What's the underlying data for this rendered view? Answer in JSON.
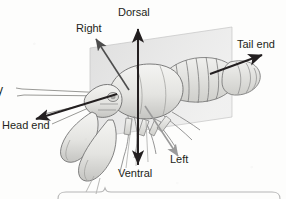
{
  "figure": {
    "organism_label": "crayfish",
    "plane_label": "sagittal plane",
    "partial_left_text": "y"
  },
  "labels": {
    "dorsal": "Dorsal",
    "ventral": "Ventral",
    "right": "Right",
    "left": "Left",
    "head_end": "Head end",
    "tail_end": "Tail end"
  },
  "arrows": [
    {
      "name": "dorsal-arrow",
      "label": "Dorsal",
      "color": "#231f20",
      "from": [
        138,
        165
      ],
      "to": [
        138,
        28
      ]
    },
    {
      "name": "ventral-arrow",
      "label": "Ventral",
      "color": "#231f20",
      "from": [
        138,
        28
      ],
      "to": [
        138,
        165
      ]
    },
    {
      "name": "right-arrow",
      "label": "Right",
      "color": "#4d4d4d",
      "from": [
        128,
        88
      ],
      "to": [
        96,
        39
      ]
    },
    {
      "name": "left-arrow",
      "label": "Left",
      "color": "#9a9a9a",
      "from": [
        146,
        108
      ],
      "to": [
        178,
        156
      ]
    },
    {
      "name": "head-end-arrow",
      "label": "Head end",
      "color": "#231f20",
      "from": [
        116,
        95
      ],
      "to": [
        37,
        119
      ]
    },
    {
      "name": "tail-end-arrow",
      "label": "Tail end",
      "color": "#231f20",
      "from": [
        211,
        73
      ],
      "to": [
        262,
        56
      ]
    }
  ],
  "colors": {
    "background": "#fdfdfc",
    "ink": "#231f20",
    "arrow_dark": "#231f20",
    "arrow_mid": "#4d4d4d",
    "arrow_light": "#9a9a9a",
    "plane_fill": "#d9d9d9",
    "plane_stroke": "#bdbdbd",
    "body_fill": "#e9e9e7",
    "body_shade": "#c9c9c6",
    "body_outline": "#6e6e6e",
    "brace": "#b5b5b5"
  },
  "brace": {
    "name": "bottom-brace",
    "span_x": [
      58,
      280
    ],
    "peak_x": 105,
    "baseline_y": 193
  }
}
